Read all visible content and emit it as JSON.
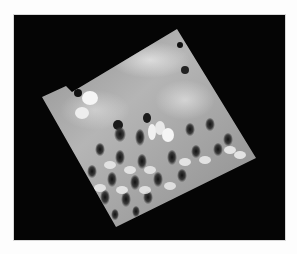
{
  "figure": {
    "frame": {
      "x": 14,
      "y": 15,
      "width": 271,
      "height": 225,
      "color": "#050505"
    },
    "background_color": "#fdfdfd",
    "surface": {
      "corners": {
        "top": [
          177,
          29
        ],
        "right": [
          256,
          158
        ],
        "bottom": [
          116,
          227
        ],
        "left": [
          42,
          97
        ]
      },
      "base_color": "#9a9a9a",
      "highlight_color": "#f2f2f2",
      "pit_color": "#1a1a1a",
      "lattice": {
        "rows": 7,
        "cols": 7
      }
    }
  }
}
